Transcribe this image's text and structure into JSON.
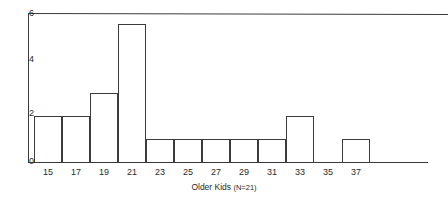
{
  "chart_data": {
    "type": "bar",
    "title": "",
    "subtitle": "",
    "xlabel": "Older Kids (N=21)",
    "ylabel": "",
    "categories": [
      "15",
      "17",
      "19",
      "21",
      "23",
      "25",
      "27",
      "29",
      "31",
      "33",
      "35",
      "37"
    ],
    "values": [
      2,
      2,
      3,
      6,
      1,
      1,
      1,
      1,
      1,
      2,
      0,
      1
    ],
    "xtick_labels": [
      "15",
      "17",
      "19",
      "21",
      "23",
      "25",
      "27",
      "29",
      "31",
      "33",
      "35",
      "37"
    ],
    "ytick_labels": [
      "0",
      "2",
      "4",
      "6"
    ],
    "ytick_values": [
      0,
      2,
      4,
      6
    ],
    "ylim": [
      0,
      6.5
    ],
    "grid": false,
    "legend": null,
    "legend_position": "none",
    "bar_fill": "#ffffff",
    "bar_edge_color": "#3b3b3b",
    "axis_color": "#3b3b3b",
    "annotations": []
  },
  "caption": {
    "label": "Older Kids",
    "note": "(N=21)",
    "full": "Older Kids (N=21)"
  },
  "axes": {
    "y_ticks": [
      {
        "label": "6",
        "value": 6
      },
      {
        "label": "4",
        "value": 4
      },
      {
        "label": "2",
        "value": 2
      },
      {
        "label": "0",
        "value": 0
      }
    ],
    "x_ticks": [
      {
        "label": "15",
        "value": 15
      },
      {
        "label": "17",
        "value": 17
      },
      {
        "label": "19",
        "value": 19
      },
      {
        "label": "21",
        "value": 21
      },
      {
        "label": "23",
        "value": 23
      },
      {
        "label": "25",
        "value": 25
      },
      {
        "label": "27",
        "value": 27
      },
      {
        "label": "29",
        "value": 29
      },
      {
        "label": "31",
        "value": 31
      },
      {
        "label": "33",
        "value": 33
      },
      {
        "label": "35",
        "value": 35
      },
      {
        "label": "37",
        "value": 37
      }
    ]
  },
  "colors": {
    "ink": "#3b3b3b",
    "text": "#2a2a2a",
    "background": "#ffffff"
  }
}
